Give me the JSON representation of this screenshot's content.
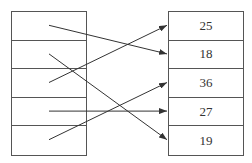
{
  "diagram": {
    "type": "mapping",
    "left_column": {
      "cells": [
        "",
        "",
        "",
        "",
        ""
      ]
    },
    "right_column": {
      "cells": [
        "25",
        "18",
        "36",
        "27",
        "19"
      ]
    },
    "arrows": [
      {
        "from_left_row": 1,
        "to_right_row": 2,
        "to_value": "18"
      },
      {
        "from_left_row": 2,
        "to_right_row": 5,
        "to_value": "19"
      },
      {
        "from_left_row": 3,
        "to_right_row": 1,
        "to_value": "25"
      },
      {
        "from_left_row": 4,
        "to_right_row": 4,
        "to_value": "27"
      },
      {
        "from_left_row": 5,
        "to_right_row": 3,
        "to_value": "36"
      }
    ],
    "line_color": "#333333",
    "border_color": "#555555"
  }
}
